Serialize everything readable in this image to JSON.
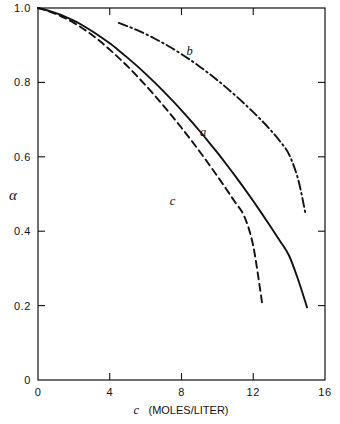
{
  "figure": {
    "background_color": "#ffffff",
    "ink_color": "#111111"
  },
  "axes": {
    "y_title": "α",
    "x_title_symbol": "c",
    "x_title_units": "(MOLES/LITER)",
    "x_title_full": "c (MOLES/LITER)",
    "x_ticks": [
      "0",
      "4",
      "8",
      "12",
      "16"
    ],
    "y_ticks": [
      "0",
      "0.2",
      "0.4",
      "0.6",
      "0.8",
      "1.0"
    ]
  },
  "curve_labels": {
    "a": "a",
    "b": "b",
    "c": "c"
  },
  "chart_data": {
    "type": "line",
    "title": "",
    "xlabel": "c (MOLES/LITER)",
    "ylabel": "α",
    "xlim": [
      0,
      16
    ],
    "ylim": [
      0,
      1.0
    ],
    "xticks": [
      0,
      4,
      8,
      12,
      16
    ],
    "yticks": [
      0,
      0.2,
      0.4,
      0.6,
      0.8,
      1.0
    ],
    "grid": false,
    "legend": "inline-curve-labels",
    "series": [
      {
        "name": "a",
        "label": "a",
        "style": "solid",
        "color": "#111111",
        "label_position": {
          "x": 9.2,
          "y": 0.655
        },
        "x": [
          0,
          0.5,
          1,
          1.5,
          2,
          2.5,
          3,
          3.5,
          4,
          4.5,
          5,
          5.5,
          6,
          6.5,
          7,
          7.5,
          8,
          8.5,
          9,
          9.5,
          10,
          10.5,
          11,
          11.5,
          12,
          12.5,
          13,
          13.5,
          14,
          14.5,
          15
        ],
        "y": [
          1.0,
          0.994,
          0.986,
          0.977,
          0.966,
          0.953,
          0.938,
          0.922,
          0.905,
          0.886,
          0.866,
          0.845,
          0.823,
          0.8,
          0.776,
          0.751,
          0.725,
          0.698,
          0.67,
          0.641,
          0.611,
          0.58,
          0.548,
          0.515,
          0.481,
          0.446,
          0.41,
          0.373,
          0.334,
          0.27,
          0.195
        ]
      },
      {
        "name": "b",
        "label": "b",
        "style": "dash-dot",
        "color": "#111111",
        "label_position": {
          "x": 8.45,
          "y": 0.875
        },
        "x": [
          4.5,
          5,
          5.5,
          6,
          6.5,
          7,
          7.5,
          8,
          8.5,
          9,
          9.5,
          10,
          10.5,
          11,
          11.5,
          12,
          12.5,
          13,
          13.5,
          14,
          14.5,
          14.9
        ],
        "y": [
          0.96,
          0.951,
          0.941,
          0.93,
          0.918,
          0.905,
          0.891,
          0.876,
          0.86,
          0.843,
          0.825,
          0.806,
          0.786,
          0.765,
          0.743,
          0.72,
          0.696,
          0.67,
          0.641,
          0.606,
          0.54,
          0.45
        ]
      },
      {
        "name": "c",
        "label": "c",
        "style": "dashed",
        "color": "#111111",
        "label_position": {
          "x": 7.5,
          "y": 0.47
        },
        "x": [
          0,
          0.5,
          1,
          1.5,
          2,
          2.5,
          3,
          3.5,
          4,
          4.5,
          5,
          5.5,
          6,
          6.5,
          7,
          7.5,
          8,
          8.5,
          9,
          9.5,
          10,
          10.5,
          11,
          11.5,
          12,
          12.5
        ],
        "y": [
          1.0,
          0.993,
          0.984,
          0.973,
          0.96,
          0.945,
          0.928,
          0.909,
          0.888,
          0.866,
          0.843,
          0.818,
          0.792,
          0.765,
          0.737,
          0.708,
          0.678,
          0.647,
          0.615,
          0.582,
          0.548,
          0.513,
          0.477,
          0.44,
          0.36,
          0.205
        ]
      }
    ]
  }
}
